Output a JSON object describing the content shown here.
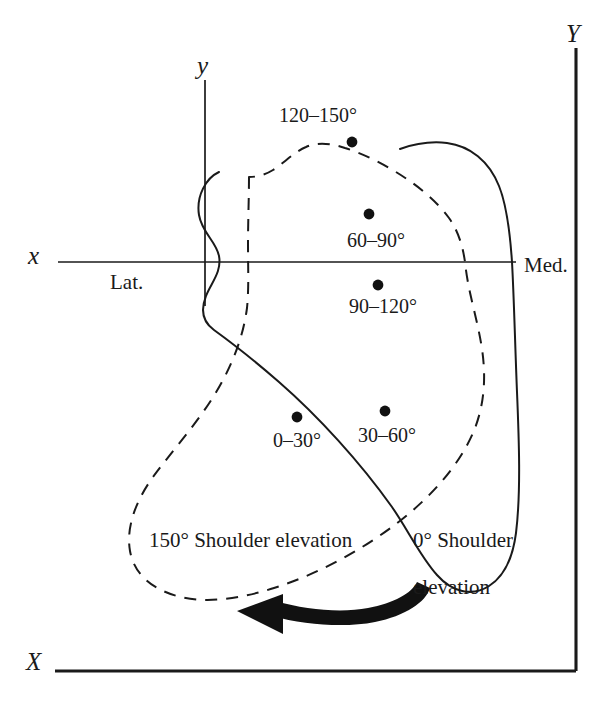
{
  "figure": {
    "type": "scientific-diagram"
  },
  "axes": {
    "outer": {
      "vertical_label": "Y",
      "horizontal_label": "X"
    },
    "inner": {
      "vertical_label": "y",
      "horizontal_label": "x"
    }
  },
  "direction_labels": {
    "lateral": "Lat.",
    "medial": "Med."
  },
  "data_points": [
    {
      "id": "bin-120-150",
      "label": "120–150°",
      "label_position": "above"
    },
    {
      "id": "bin-60-90",
      "label": "60–90°",
      "label_position": "below"
    },
    {
      "id": "bin-90-120",
      "label": "90–120°",
      "label_position": "below"
    },
    {
      "id": "bin-0-30",
      "label": "0–30°",
      "label_position": "below"
    },
    {
      "id": "bin-30-60",
      "label": "30–60°",
      "label_position": "below"
    }
  ],
  "contours": [
    {
      "id": "contour-0-deg",
      "style": "solid",
      "annotation_line1": "0° Shoulder",
      "annotation_line2": "elevation"
    },
    {
      "id": "contour-150-deg",
      "style": "dashed",
      "annotation_line1": "150° Shoulder elevation"
    }
  ],
  "rotation_arrow": {
    "name": "rotation-arrow",
    "direction": "leftward-curved"
  },
  "colors": {
    "ink": "#1a1a1a",
    "background": "#ffffff"
  }
}
